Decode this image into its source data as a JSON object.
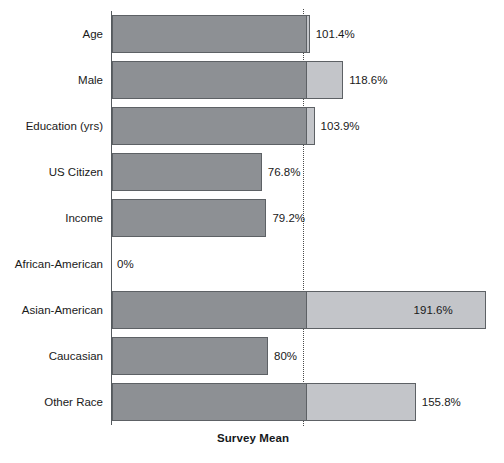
{
  "chart_data": {
    "type": "bar",
    "orientation": "horizontal",
    "title": "",
    "subtitle": "",
    "xlabel": "Survey Mean",
    "ylabel": "",
    "grid": false,
    "legend": null,
    "xlim": [
      0,
      200
    ],
    "reference_line": {
      "label": "Survey Mean",
      "value": 100,
      "style": "dotted"
    },
    "categories": [
      "Age",
      "Male",
      "Education (yrs)",
      "US Citizen",
      "Income",
      "African-American",
      "Asian-American",
      "Caucasian",
      "Other Race"
    ],
    "values": [
      101.4,
      118.6,
      103.9,
      76.8,
      79.2,
      0,
      191.6,
      80,
      155.8
    ],
    "value_labels": [
      "101.4%",
      "118.6%",
      "103.9%",
      "76.8%",
      "79.2%",
      "0%",
      "191.6%",
      "80%",
      "155.8%"
    ],
    "label_placement": [
      "outside",
      "outside",
      "outside",
      "outside",
      "outside",
      "outside",
      "inside",
      "outside",
      "outside"
    ],
    "colors": {
      "bar_below_mean": "#8d9094",
      "bar_above_mean": "#c3c5c9",
      "bar_border": "#5d6165",
      "axis": "#555a5e",
      "reference_line": "#4a4a4a",
      "text": "#1a1a1a",
      "background": "#ffffff"
    }
  }
}
